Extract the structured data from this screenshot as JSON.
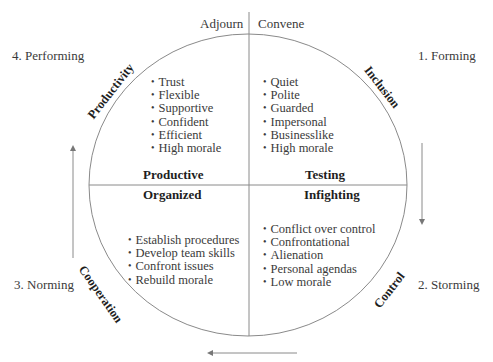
{
  "diagram": {
    "top_labels": {
      "left": "Adjourn",
      "right": "Convene"
    },
    "stages": [
      {
        "label": "1. Forming",
        "position": "top-right"
      },
      {
        "label": "2. Storming",
        "position": "bottom-right"
      },
      {
        "label": "3. Norming",
        "position": "bottom-left"
      },
      {
        "label": "4. Performing",
        "position": "top-left"
      }
    ],
    "arc_labels": {
      "top_right": "Inclusion",
      "bottom_right": "Control",
      "bottom_left": "Cooperation",
      "top_left": "Productivity"
    },
    "quadrants": {
      "top_left": {
        "heading": "Productive",
        "items": [
          "Trust",
          "Flexible",
          "Supportive",
          "Confident",
          "Efficient",
          "High morale"
        ]
      },
      "top_right": {
        "heading": "Testing",
        "items": [
          "Quiet",
          "Polite",
          "Guarded",
          "Impersonal",
          "Businesslike",
          "High morale"
        ]
      },
      "bottom_left": {
        "heading": "Organized",
        "items": [
          "Establish procedures",
          "Develop team skills",
          "Confront issues",
          "Rebuild morale"
        ]
      },
      "bottom_right": {
        "heading": "Infighting",
        "items": [
          "Conflict over control",
          "Confrontational",
          "Alienation",
          "Personal agendas",
          "Low morale"
        ]
      }
    },
    "arrows": [
      {
        "direction": "down",
        "side": "right"
      },
      {
        "direction": "left",
        "side": "bottom"
      },
      {
        "direction": "up",
        "side": "left"
      }
    ],
    "colors": {
      "line": "#8a8a8a",
      "text": "#3a3a3a",
      "heading": "#1e1e1e"
    }
  }
}
